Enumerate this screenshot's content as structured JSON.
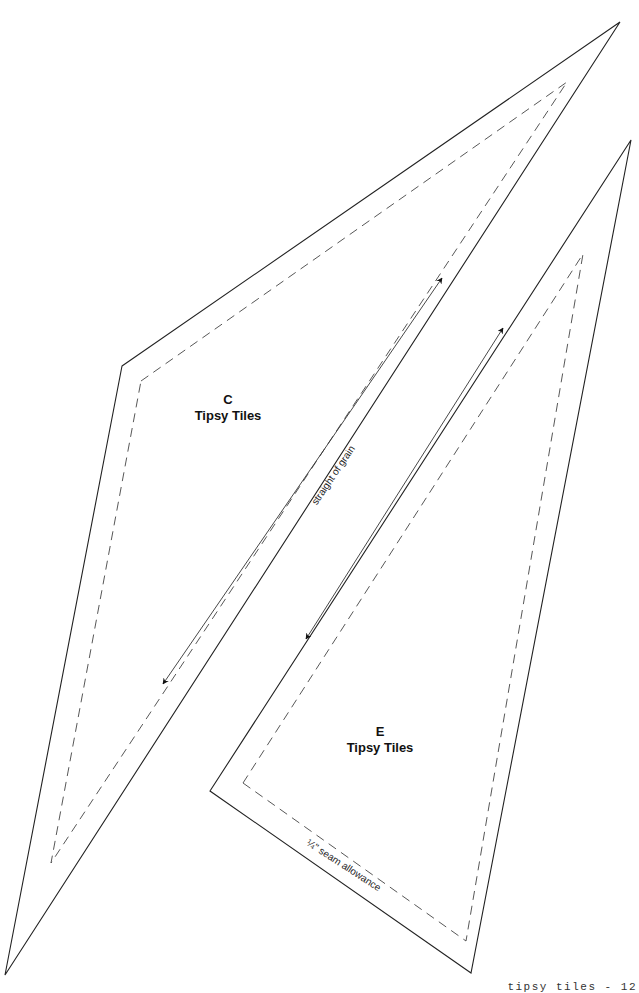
{
  "pieces": [
    {
      "id": "C",
      "letter": "C",
      "name": "Tipsy Tiles",
      "grain_label": "straight of grain",
      "outline": [
        [
          122,
          366
        ],
        [
          620,
          22
        ],
        [
          5,
          975
        ]
      ],
      "seam": [
        [
          141,
          381
        ],
        [
          567,
          82
        ],
        [
          51,
          863
        ]
      ],
      "grain_arrow": {
        "from": [
          163,
          684
        ],
        "to": [
          442,
          278
        ]
      }
    },
    {
      "id": "E",
      "letter": "E",
      "name": "Tipsy Tiles",
      "seam_label": "¼\" seam allowance",
      "outline": [
        [
          210,
          791
        ],
        [
          631,
          140
        ],
        [
          471,
          973
        ]
      ],
      "seam": [
        [
          243,
          783
        ],
        [
          583,
          254
        ],
        [
          466,
          941
        ]
      ],
      "grain_arrow": {
        "from": [
          306,
          639
        ],
        "to": [
          503,
          328
        ]
      }
    }
  ],
  "footer": {
    "page_label": "tipsy tiles - 12"
  },
  "colors": {
    "line": "#222222",
    "background": "#ffffff"
  }
}
